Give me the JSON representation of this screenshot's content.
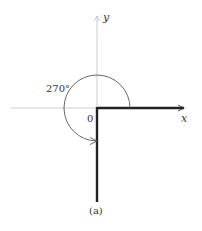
{
  "figure": {
    "caption": "(a)",
    "angle_label": "270°",
    "origin_label": "0",
    "x_axis_label": "x",
    "y_axis_label": "y",
    "angle_degrees": 270,
    "initial_side": "positive x-axis",
    "terminal_side": "negative y-axis",
    "rotation": "counterclockwise"
  },
  "colors": {
    "axis": "#cccccc",
    "ray": "#222222",
    "arc": "#555555",
    "text": "#333333"
  }
}
